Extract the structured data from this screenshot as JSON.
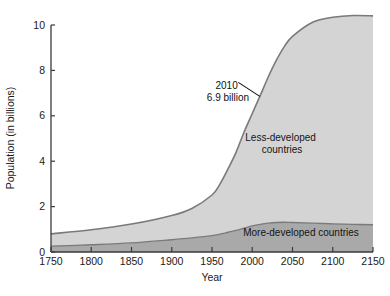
{
  "figure": {
    "name": "world-population-growth-area-chart"
  },
  "chart_data": {
    "type": "area",
    "title": "",
    "subtitle": "",
    "xlabel": "Year",
    "ylabel": "Population (in billions)",
    "xlim": [
      1750,
      2150
    ],
    "ylim": [
      0,
      10
    ],
    "grid": false,
    "stacked": true,
    "legend_position": "inline-labels",
    "xticks": [
      1750,
      1800,
      1850,
      1900,
      1950,
      2000,
      2050,
      2100,
      2150
    ],
    "xtick_labels": [
      "1750",
      "1800",
      "1850",
      "1900",
      "1950",
      "2000",
      "2050",
      "2100",
      "2150"
    ],
    "yticks": [
      0,
      2,
      4,
      6,
      8,
      10
    ],
    "ytick_labels": [
      "0",
      "2",
      "4",
      "6",
      "8",
      "10"
    ],
    "x": [
      1750,
      1800,
      1850,
      1900,
      1925,
      1950,
      1960,
      1970,
      1980,
      1990,
      2000,
      2010,
      2020,
      2030,
      2040,
      2050,
      2075,
      2100,
      2125,
      2150
    ],
    "series": [
      {
        "name": "More-developed countries",
        "label": "More-developed countries",
        "color": "#a9a9a9",
        "values": [
          0.26,
          0.32,
          0.4,
          0.54,
          0.62,
          0.72,
          0.79,
          0.87,
          0.95,
          1.05,
          1.15,
          1.22,
          1.27,
          1.3,
          1.31,
          1.3,
          1.27,
          1.24,
          1.22,
          1.2
        ]
      },
      {
        "name": "Less-developed countries",
        "label": "Less-developed countries",
        "color": "#d4d4d4",
        "values": [
          0.54,
          0.66,
          0.83,
          1.07,
          1.3,
          1.79,
          2.21,
          2.8,
          3.45,
          4.25,
          4.95,
          5.68,
          6.45,
          7.15,
          7.75,
          8.2,
          8.85,
          9.1,
          9.2,
          9.2
        ]
      }
    ],
    "totals": [
      0.8,
      0.98,
      1.23,
      1.61,
      1.92,
      2.51,
      3.0,
      3.67,
      4.4,
      5.3,
      6.1,
      6.9,
      7.72,
      8.45,
      9.06,
      9.5,
      10.12,
      10.34,
      10.42,
      10.4
    ],
    "annotations": [
      {
        "name": "population-2010-callout",
        "line1": "2010",
        "line2": "6.9 billion",
        "point_x": 2010,
        "point_y": 6.9
      }
    ]
  },
  "axes": {
    "y_axis_title": "Population (in billions)",
    "x_axis_title": "Year"
  }
}
